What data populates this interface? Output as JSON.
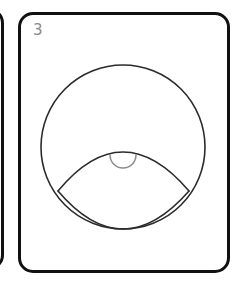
{
  "card": {
    "index_label": "3",
    "index_color": "#8a8a8a",
    "border_color": "#111111",
    "background_color": "#ffffff",
    "border_width": 3,
    "corner_radius": 15,
    "x": 18,
    "y": 12,
    "width": 212,
    "height": 261
  },
  "partial_card_left": {
    "border_color": "#111111",
    "background_color": "#ffffff",
    "border_width": 3,
    "corner_radius": 15,
    "x": -40,
    "y": 8,
    "width": 44,
    "height": 262
  },
  "figure": {
    "stroke_color": "#2b2b2b",
    "stroke_color_light": "#8c8c8c",
    "fill": "none",
    "shapes": [
      {
        "name": "outer-circle",
        "type": "circle",
        "cx": 123,
        "cy": 147,
        "r": 82,
        "stroke": "#2b2b2b",
        "stroke_width": 1.6
      },
      {
        "name": "lens-upper-arc",
        "type": "arc",
        "start_x": 58,
        "start_y": 191,
        "end_x": 189,
        "end_y": 191,
        "apex_x": 123,
        "apex_y": 152,
        "stroke": "#2b2b2b",
        "stroke_width": 1.6
      },
      {
        "name": "lens-lower-arc",
        "type": "arc",
        "start_x": 58,
        "start_y": 191,
        "end_x": 189,
        "end_y": 191,
        "apex_x": 123,
        "apex_y": 229,
        "stroke": "#2b2b2b",
        "stroke_width": 1.6
      },
      {
        "name": "pupil-semicircle",
        "type": "semicircle-down",
        "cx": 123,
        "cy": 155,
        "r": 13,
        "stroke": "#8c8c8c",
        "stroke_width": 1.5
      }
    ]
  }
}
